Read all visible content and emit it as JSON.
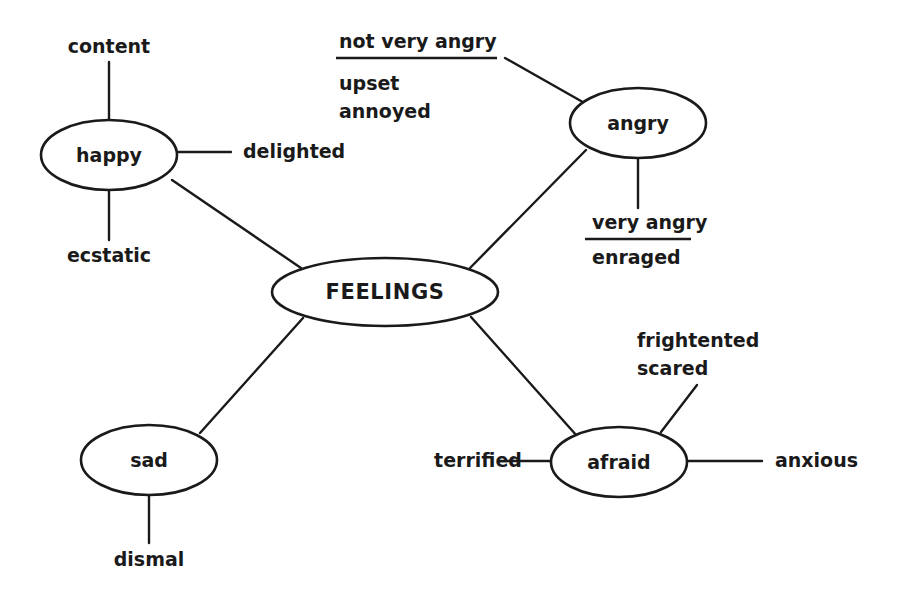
{
  "diagram": {
    "title": "FEELINGS",
    "type": "mind-map",
    "background_color": "#ffffff",
    "stroke_color": "#1a1a1a",
    "central_node": {
      "id": "feelings",
      "label": "FEELINGS",
      "cx": 385,
      "cy": 292,
      "rx": 113,
      "ry": 34
    },
    "branch_nodes": [
      {
        "id": "happy",
        "label": "happy",
        "cx": 109,
        "cy": 155,
        "rx": 68,
        "ry": 35
      },
      {
        "id": "angry",
        "label": "angry",
        "cx": 638,
        "cy": 123,
        "rx": 68,
        "ry": 35
      },
      {
        "id": "sad",
        "label": "sad",
        "cx": 149,
        "cy": 460,
        "rx": 68,
        "ry": 35
      },
      {
        "id": "afraid",
        "label": "afraid",
        "cx": 619,
        "cy": 462,
        "rx": 68,
        "ry": 35
      }
    ],
    "leaf_labels": [
      {
        "id": "content",
        "text": "content",
        "x": 109,
        "y": 47,
        "anchor": "middle",
        "underline": false
      },
      {
        "id": "ecstatic",
        "text": "ecstatic",
        "x": 109,
        "y": 256,
        "anchor": "middle",
        "underline": false
      },
      {
        "id": "delighted",
        "text": "delighted",
        "x": 243,
        "y": 152,
        "anchor": "start",
        "underline": false
      },
      {
        "id": "not-very-angry",
        "text": "not very angry",
        "x": 339,
        "y": 42,
        "anchor": "start",
        "underline": true,
        "rule_x1": 336,
        "rule_x2": 497,
        "rule_y": 58
      },
      {
        "id": "upset",
        "text": "upset",
        "x": 339,
        "y": 84,
        "anchor": "start",
        "underline": false
      },
      {
        "id": "annoyed",
        "text": "annoyed",
        "x": 339,
        "y": 112,
        "anchor": "start",
        "underline": false
      },
      {
        "id": "very-angry",
        "text": "very angry",
        "x": 592,
        "y": 223,
        "anchor": "start",
        "underline": true,
        "rule_x1": 585,
        "rule_x2": 691,
        "rule_y": 239
      },
      {
        "id": "enraged",
        "text": "enraged",
        "x": 592,
        "y": 258,
        "anchor": "start",
        "underline": false
      },
      {
        "id": "frightented",
        "text": "frightented",
        "x": 637,
        "y": 341,
        "anchor": "start",
        "underline": false
      },
      {
        "id": "scared",
        "text": "scared",
        "x": 637,
        "y": 369,
        "anchor": "start",
        "underline": false
      },
      {
        "id": "terrified",
        "text": "terrified",
        "x": 478,
        "y": 461,
        "anchor": "middle",
        "underline": false
      },
      {
        "id": "anxious",
        "text": "anxious",
        "x": 775,
        "y": 461,
        "anchor": "start",
        "underline": false
      },
      {
        "id": "dismal",
        "text": "dismal",
        "x": 149,
        "y": 560,
        "anchor": "middle",
        "underline": false
      }
    ],
    "edges": [
      {
        "id": "feelings-happy",
        "from": "feelings",
        "to": "happy",
        "x1": 301,
        "y1": 268,
        "x2": 172,
        "y2": 180
      },
      {
        "id": "feelings-angry",
        "from": "feelings",
        "to": "angry",
        "x1": 470,
        "y1": 268,
        "x2": 586,
        "y2": 150
      },
      {
        "id": "feelings-sad",
        "from": "feelings",
        "to": "sad",
        "x1": 303,
        "y1": 318,
        "x2": 200,
        "y2": 433
      },
      {
        "id": "feelings-afraid",
        "from": "feelings",
        "to": "afraid",
        "x1": 471,
        "y1": 317,
        "x2": 577,
        "y2": 436
      },
      {
        "id": "happy-content",
        "from": "happy",
        "to": "content",
        "x1": 109,
        "y1": 120,
        "x2": 109,
        "y2": 62
      },
      {
        "id": "happy-ecstatic",
        "from": "happy",
        "to": "ecstatic",
        "x1": 109,
        "y1": 190,
        "x2": 109,
        "y2": 240
      },
      {
        "id": "happy-delighted",
        "from": "happy",
        "to": "delighted",
        "x1": 177,
        "y1": 152,
        "x2": 231,
        "y2": 152
      },
      {
        "id": "angry-notveryangry",
        "from": "angry",
        "to": "not-very-angry",
        "x1": 588,
        "y1": 105,
        "x2": 505,
        "y2": 58
      },
      {
        "id": "angry-veryangry",
        "from": "angry",
        "to": "very-angry",
        "x1": 638,
        "y1": 158,
        "x2": 638,
        "y2": 208
      },
      {
        "id": "afraid-frightented",
        "from": "afraid",
        "to": "frightented",
        "x1": 661,
        "y1": 432,
        "x2": 697,
        "y2": 385
      },
      {
        "id": "afraid-terrified",
        "from": "afraid",
        "to": "terrified",
        "x1": 551,
        "y1": 461,
        "x2": 498,
        "y2": 461
      },
      {
        "id": "afraid-anxious",
        "from": "afraid",
        "to": "anxious",
        "x1": 687,
        "y1": 461,
        "x2": 762,
        "y2": 461
      },
      {
        "id": "sad-dismal",
        "from": "sad",
        "to": "dismal",
        "x1": 149,
        "y1": 495,
        "x2": 149,
        "y2": 543
      }
    ]
  }
}
